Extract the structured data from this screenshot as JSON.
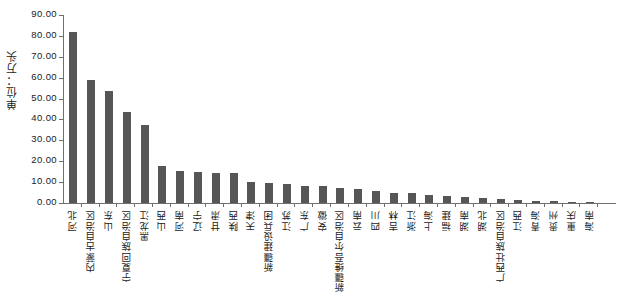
{
  "chart_data": {
    "type": "bar",
    "title": "",
    "subtitle": "",
    "ylabel": "单位：万头",
    "xlabel": "",
    "ylim": [
      0,
      90
    ],
    "ytick_step": 10,
    "ytick_labels": [
      "0.00",
      "10.00",
      "20.00",
      "30.00",
      "40.00",
      "50.00",
      "60.00",
      "70.00",
      "80.00",
      "90.00"
    ],
    "grid": false,
    "legend": null,
    "bar_color": "#565656",
    "axis_color": "#6f6f6f",
    "categories": [
      "河北",
      "内蒙古自治区",
      "山东",
      "宁夏回族自治区",
      "黑龙江",
      "山西",
      "河南",
      "辽宁",
      "甘肃",
      "陕西",
      "天津",
      "新疆建设兵团",
      "江苏",
      "广东",
      "安徽",
      "新疆维吾尔自治区",
      "云南",
      "四川",
      "吉林",
      "浙江",
      "上海",
      "福建",
      "湖南",
      "湖北",
      "广西壮族自治区",
      "江西",
      "青海",
      "贵州",
      "重庆",
      "海南"
    ],
    "values": [
      82.1,
      58.9,
      53.4,
      43.8,
      37.4,
      17.9,
      15.3,
      14.8,
      14.3,
      14.3,
      10.2,
      9.4,
      8.9,
      8.3,
      8.2,
      7.2,
      6.9,
      5.6,
      4.9,
      4.7,
      3.7,
      3.4,
      3.0,
      2.6,
      2.1,
      1.4,
      1.1,
      0.9,
      0.7,
      0.5
    ]
  }
}
